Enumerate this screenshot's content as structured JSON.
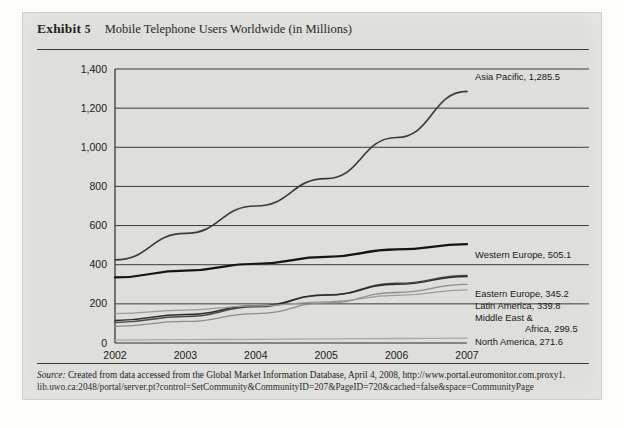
{
  "exhibit": {
    "label": "Exhibit",
    "number": "5",
    "title": "Mobile Telephone Users Worldwide (in Millions)"
  },
  "source": {
    "prefix": "Source:",
    "line1": " Created from data accessed from the Global Market Information Database, April 4, 2008, http://www.portal.euromonitor.com.proxy1.",
    "line2": "lib.uwo.ca:2048/portal/server.pt?control=SetCommunity&CommunityID=207&PageID=720&cached=false&space=CommunityPage"
  },
  "colors": {
    "panel": "#dededa",
    "rule": "#3a3a38",
    "gridline": "#3b3b39",
    "asia_pacific": "#3c3c3a",
    "western_europe": "#141414",
    "eastern_europe": "#4a4a48",
    "latin_america": "#2e2e2c",
    "middle_east_africa": "#8d8d89",
    "north_america": "#9b9b97",
    "australasia": "#a9a9a5"
  },
  "chart_data": {
    "type": "line",
    "title": "Mobile Telephone Users Worldwide (in Millions)",
    "xlabel": "",
    "ylabel": "",
    "x": [
      "2002",
      "2003",
      "2004",
      "2005",
      "2006",
      "2007"
    ],
    "ylim": [
      0,
      1400
    ],
    "yticks": [
      "0",
      "200",
      "400",
      "600",
      "800",
      "1,000",
      "1,200",
      "1,400"
    ],
    "ytick_values": [
      0,
      200,
      400,
      600,
      800,
      1000,
      1200,
      1400
    ],
    "grid": true,
    "legend": "inline-right-labels",
    "series": [
      {
        "name": "Asia Pacific",
        "end_label": "Asia Pacific, 1,285.5",
        "end_value": 1285.5,
        "values": [
          425,
          560,
          700,
          840,
          1050,
          1285.5
        ]
      },
      {
        "name": "Western Europe",
        "end_label": "Western Europe, 505.1",
        "end_value": 505.1,
        "values": [
          335,
          370,
          405,
          440,
          478,
          505.1
        ]
      },
      {
        "name": "Eastern Europe",
        "end_label": "Eastern Europe, 345.2",
        "end_value": 345.2,
        "values": [
          105,
          135,
          185,
          245,
          305,
          345.2
        ]
      },
      {
        "name": "Latin America",
        "end_label": "Latin America, 339.8",
        "end_value": 339.8,
        "values": [
          115,
          145,
          190,
          245,
          300,
          339.8
        ]
      },
      {
        "name": "Middle East & Africa",
        "end_label": "Middle East &",
        "end_label2": "Africa, 299.5",
        "end_value": 299.5,
        "values": [
          85,
          110,
          150,
          205,
          258,
          299.5
        ]
      },
      {
        "name": "North America",
        "end_label": "North America, 271.6",
        "end_value": 271.6,
        "values": [
          150,
          168,
          190,
          210,
          243,
          271.6
        ]
      },
      {
        "name": "Australasia",
        "end_label": "Australasia, 25.0",
        "end_value": 25.0,
        "values": [
          15,
          17,
          19,
          21,
          23,
          25
        ]
      }
    ]
  }
}
